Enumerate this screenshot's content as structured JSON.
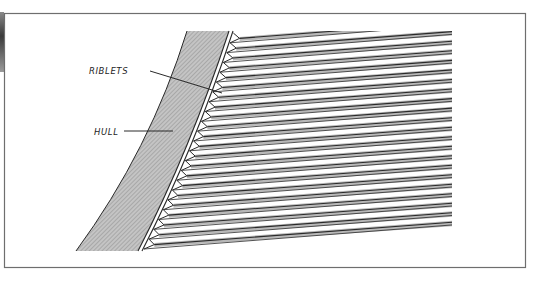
{
  "diagram": {
    "title": "",
    "labels": {
      "riblets": "RIBLETS",
      "hull": "HULL"
    },
    "colors": {
      "frame": "#6e6e6e",
      "ink": "#2a2a2a",
      "hull_fill": "#b4b4b4",
      "riblet_shade": "#b8b8b8",
      "background": "#ffffff"
    },
    "elements": [
      {
        "id": "hull",
        "description": "Curved hatched hull cross-section"
      },
      {
        "id": "riblets",
        "description": "Sawtooth riblet surface on hull skin with longitudinal grooves"
      }
    ],
    "riblet_count": 22
  }
}
